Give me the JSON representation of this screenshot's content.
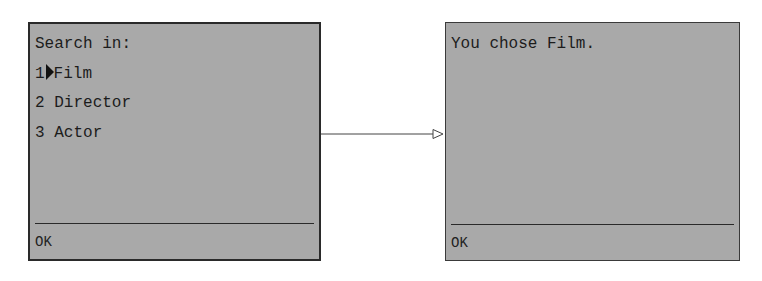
{
  "screens": [
    {
      "id": "search-menu",
      "lines": {
        "title": "Search in:"
      },
      "menu": [
        {
          "number": "1",
          "label": "Film",
          "selected": true
        },
        {
          "number": "2",
          "label": "Director",
          "selected": false
        },
        {
          "number": "3",
          "label": "Actor",
          "selected": false
        }
      ],
      "softkey": "OK"
    },
    {
      "id": "confirmation",
      "lines": {
        "message": "You chose Film."
      },
      "softkey": "OK"
    }
  ],
  "connector": {
    "type": "arrow",
    "from": "search-menu",
    "to": "confirmation",
    "head": "open-triangle"
  },
  "colors": {
    "screen_bg": "#a9a9a9",
    "border": "#2a2a2a",
    "text": "#1c1c1c"
  }
}
